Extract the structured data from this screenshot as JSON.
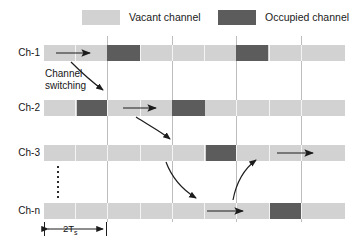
{
  "figure": {
    "type": "timing-diagram",
    "width": 353,
    "height": 249,
    "background": "#ffffff"
  },
  "legend": {
    "items": [
      {
        "label": "Vacant channel",
        "color": "#d2d2d2",
        "x": 82,
        "y": 10
      },
      {
        "label": "Occupied channel",
        "color": "#5c5c5c",
        "x": 218,
        "y": 10
      }
    ]
  },
  "axis": {
    "bar_left": 44,
    "bar_right": 345,
    "gridlines": [
      107,
      172,
      236,
      301
    ],
    "gridline_top": 36,
    "gridline_bottom": 222,
    "segment_width": 32.5,
    "scale_label": "2T",
    "scale_sub": "s",
    "scale_from": 44,
    "scale_to": 107,
    "scale_y": 228
  },
  "rows": [
    {
      "id": "ch-1",
      "label": "Ch-1",
      "y": 45,
      "height": 16,
      "occupied": [
        {
          "x": 107,
          "w": 33
        },
        {
          "x": 236,
          "w": 32
        }
      ],
      "arrow": {
        "x1": 56,
        "y": 53,
        "x2": 95
      }
    },
    {
      "id": "ch-2",
      "label": "Ch-2",
      "y": 100,
      "height": 16,
      "occupied": [
        {
          "x": 77,
          "w": 30
        },
        {
          "x": 172,
          "w": 33
        }
      ],
      "arrow": {
        "x1": 123,
        "y": 108,
        "x2": 160
      }
    },
    {
      "id": "ch-3",
      "label": "Ch-3",
      "y": 145,
      "height": 16,
      "occupied": [
        {
          "x": 206,
          "w": 30
        }
      ],
      "arrow": {
        "x1": 275,
        "y": 153,
        "x2": 317
      }
    },
    {
      "id": "ch-n",
      "label": "Ch-n",
      "y": 203,
      "height": 16,
      "occupied": [
        {
          "x": 270,
          "w": 31
        }
      ],
      "arrow": {
        "x1": 207,
        "y": 211,
        "x2": 247
      }
    }
  ],
  "annotations": {
    "channel_switching": {
      "text": "Channel\nswitching",
      "x": 45,
      "y": 68
    },
    "ellipsis_dots": {
      "x": 57,
      "y": 166,
      "count": 7
    }
  },
  "curved_arrows": [
    {
      "name": "ch1-to-ch2",
      "path": "M 69 60 C 80 76, 92 84, 104 92"
    },
    {
      "name": "ch2-to-ch3",
      "path": "M 135 116 C 150 126, 160 132, 172 141"
    },
    {
      "name": "ch3-to-chn",
      "path": "M 165 161 C 172 176, 184 190, 198 199"
    },
    {
      "name": "chn-to-ch3",
      "path": "M 232 199 C 236 182, 244 168, 255 160"
    }
  ],
  "colors": {
    "vacant": "#d2d2d2",
    "occupied": "#5c5c5c",
    "gridline": "#bdbdbd",
    "ink": "#161616"
  }
}
